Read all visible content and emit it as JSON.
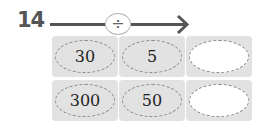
{
  "problem": {
    "number": "14",
    "operator": "÷",
    "operator_name": "divide",
    "rows": [
      {
        "cells": [
          "30",
          "5",
          ""
        ]
      },
      {
        "cells": [
          "300",
          "50",
          ""
        ]
      }
    ]
  }
}
